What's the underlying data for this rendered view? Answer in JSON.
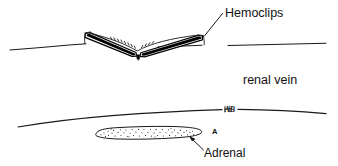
{
  "figure": {
    "type": "medical-line-drawing",
    "caption_labels": {
      "hemoclips": "Hemoclips",
      "renal_vein": "renal vein",
      "adrenal": "Adrenal",
      "marker_a": "A",
      "scribble_ab": "AB"
    },
    "colors": {
      "ink": "#1a1a1a",
      "solid_black": "#000000",
      "background": "#ffffff",
      "stipple": "#2a2a2a"
    },
    "structures": [
      {
        "name": "hemoclips",
        "description": "V-shaped surgical clip applied across vessel"
      },
      {
        "name": "renal-vein",
        "description": "upper horizontal vessel line"
      },
      {
        "name": "adrenal-gland",
        "description": "stippled elongated oval below lower vessel line"
      }
    ]
  }
}
